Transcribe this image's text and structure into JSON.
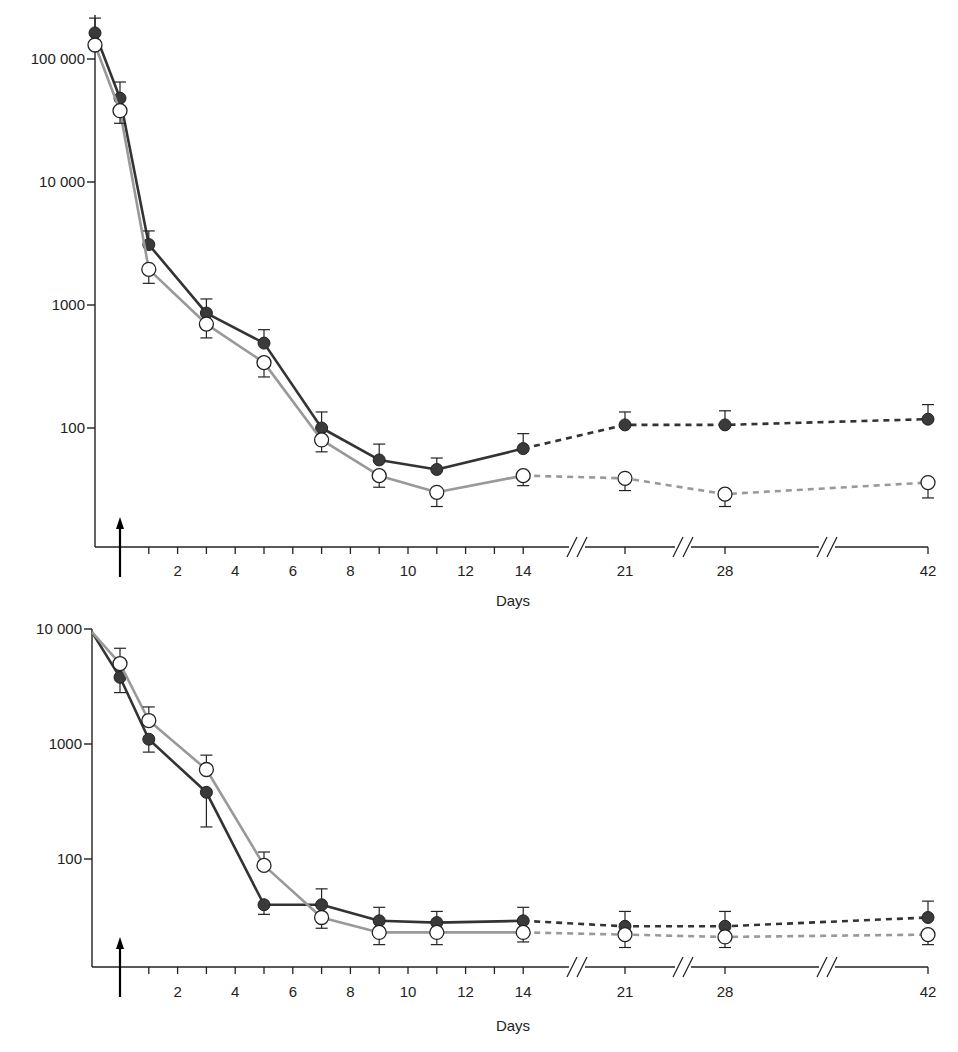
{
  "colors": {
    "filled_series": "#333333",
    "open_series": "#999999",
    "axis": "#222222"
  },
  "chart_data": [
    {
      "type": "line",
      "name": "top-panel",
      "title": "",
      "xlabel": "Days",
      "ylabel": "",
      "yscale": "log",
      "ylim": [
        15,
        200000
      ],
      "y_ticks": [
        {
          "value": 100000,
          "label": "100 000"
        },
        {
          "value": 10000,
          "label": "10 000"
        },
        {
          "value": 1000,
          "label": "1000"
        },
        {
          "value": 100,
          "label": "100"
        }
      ],
      "x_ticks": [
        1,
        2,
        3,
        4,
        5,
        6,
        7,
        8,
        9,
        10,
        11,
        12,
        13,
        14,
        21,
        28,
        42
      ],
      "x_tick_labels": [
        "2",
        "4",
        "6",
        "8",
        "10",
        "12",
        "14",
        "21",
        "28",
        "42"
      ],
      "x_breaks": [
        "14-21",
        "21-28",
        "28-42"
      ],
      "dose_marker": {
        "day": 0,
        "symbol": "arrow-up"
      },
      "grid": false,
      "legend": "none",
      "x": [
        -1,
        0,
        1,
        3,
        5,
        7,
        9,
        11,
        14,
        21,
        28,
        42
      ],
      "series": [
        {
          "name": "filled circles",
          "marker": "filled-circle",
          "values": [
            163000,
            48000,
            3100,
            860,
            490,
            100,
            55,
            46,
            68,
            106,
            106,
            118
          ],
          "error_upper": [
            215000,
            65000,
            4000,
            1120,
            630,
            135,
            74,
            57,
            90,
            135,
            138,
            155
          ],
          "dashed_from_x": 14
        },
        {
          "name": "open circles",
          "marker": "open-circle",
          "values": [
            130000,
            38000,
            1950,
            700,
            340,
            80,
            41,
            30,
            41,
            39,
            29,
            36
          ],
          "error_lower": [
            null,
            30000,
            1500,
            540,
            260,
            64,
            33,
            23,
            34,
            31,
            23,
            27
          ],
          "dashed_from_x": 14
        }
      ]
    },
    {
      "type": "line",
      "name": "bottom-panel",
      "title": "",
      "xlabel": "Days",
      "ylabel": "",
      "yscale": "log",
      "ylim": [
        12,
        10000
      ],
      "y_ticks": [
        {
          "value": 10000,
          "label": "10 000"
        },
        {
          "value": 1000,
          "label": "1000"
        },
        {
          "value": 100,
          "label": "100"
        }
      ],
      "x_ticks": [
        1,
        2,
        3,
        4,
        5,
        6,
        7,
        8,
        9,
        10,
        11,
        12,
        13,
        14,
        21,
        28,
        42
      ],
      "x_tick_labels": [
        "2",
        "4",
        "6",
        "8",
        "10",
        "12",
        "14",
        "21",
        "28",
        "42"
      ],
      "x_breaks": [
        "14-21",
        "21-28",
        "28-42"
      ],
      "dose_marker": {
        "day": 0,
        "symbol": "arrow-up"
      },
      "grid": false,
      "legend": "none",
      "x": [
        -1,
        0,
        1,
        3,
        5,
        7,
        9,
        11,
        14,
        21,
        28,
        42
      ],
      "series": [
        {
          "name": "filled circles",
          "marker": "filled-circle",
          "values": [
            9400,
            3800,
            1100,
            380,
            40,
            40,
            29,
            28,
            29,
            26,
            26,
            31
          ],
          "error_lower": [
            null,
            2800,
            850,
            190,
            33,
            null,
            24,
            null,
            null,
            null,
            null,
            null
          ],
          "error_upper": [
            null,
            null,
            null,
            null,
            null,
            55,
            38,
            35,
            38,
            35,
            35,
            43
          ],
          "dashed_from_x": 14
        },
        {
          "name": "open circles",
          "marker": "open-circle",
          "values": [
            9400,
            5000,
            1600,
            600,
            88,
            31,
            23,
            23,
            23,
            22,
            21,
            22
          ],
          "error_upper": [
            null,
            6800,
            2100,
            800,
            115,
            null,
            null,
            null,
            null,
            null,
            null,
            null
          ],
          "error_lower": [
            null,
            null,
            null,
            null,
            null,
            25,
            18,
            18,
            19,
            17,
            17,
            18
          ],
          "dashed_from_x": 14
        }
      ]
    }
  ]
}
